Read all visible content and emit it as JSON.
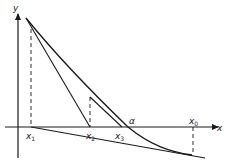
{
  "figure": {
    "colors": {
      "stroke": "#1a1a1a",
      "background": "#ffffff"
    },
    "axes": {
      "x_label": "x",
      "y_label": "y"
    },
    "labels": {
      "x1": "x",
      "x1_sub": "1",
      "x2": "x",
      "x2_sub": "2",
      "x3": "x",
      "x3_sub": "3",
      "x0": "x",
      "x0_sub": "0",
      "root": "α"
    }
  }
}
